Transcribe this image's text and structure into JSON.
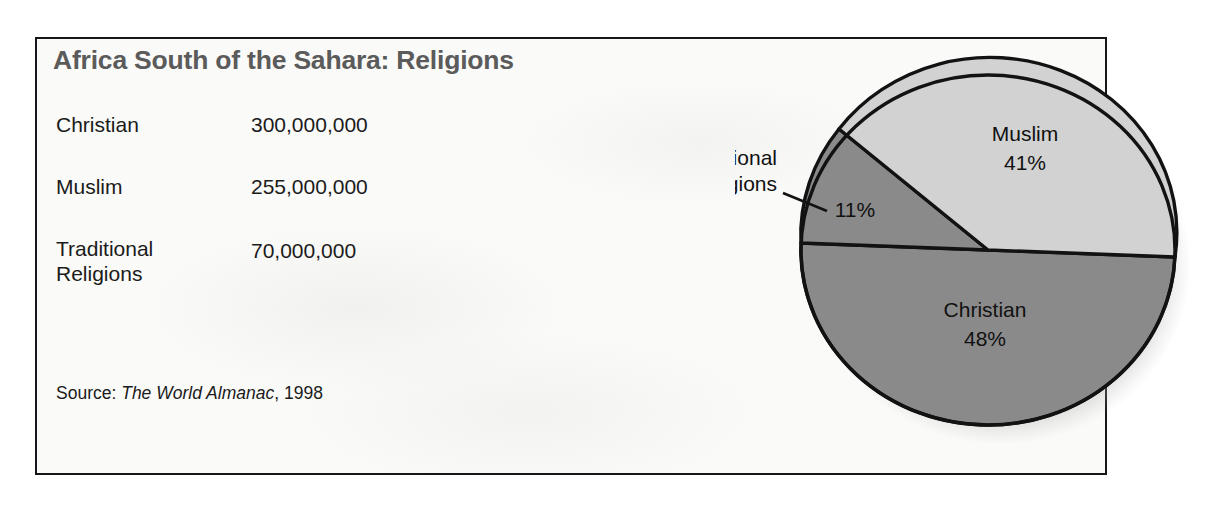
{
  "figure": {
    "title": "Africa South of the Sahara: Religions",
    "source_prefix": "Source: ",
    "source_title": "The World Almanac",
    "source_suffix": ", 1998"
  },
  "table": {
    "rows": [
      {
        "label": "Christian",
        "value": "300,000,000"
      },
      {
        "label": "Muslim",
        "value": "255,000,000"
      },
      {
        "label": "Traditional\nReligions",
        "value": "70,000,000"
      }
    ]
  },
  "pie_labels": {
    "muslim_name": "Muslim",
    "muslim_pct": "41%",
    "christian_name": "Christian",
    "christian_pct": "48%",
    "traditional_callout_line1": "Traditional",
    "traditional_callout_line2": "Religions",
    "traditional_pct": "11%"
  },
  "colors": {
    "christian_fill": "#8a8a8a",
    "muslim_fill": "#d2d2d2",
    "traditional_fill": "#8a8a8a",
    "outline": "#121212",
    "title_gray": "#5b5b5b",
    "panel_bg": "#fafaf8",
    "text": "#1b1b1b"
  },
  "chart_data": {
    "type": "pie",
    "title": "Africa South of the Sahara: Religions",
    "categories": [
      "Christian",
      "Muslim",
      "Traditional Religions"
    ],
    "values": [
      48,
      41,
      11
    ],
    "value_unit": "percent",
    "absolute_values": [
      300000000,
      255000000,
      70000000
    ],
    "absolute_unit": "people",
    "labels": [
      "Christian 48%",
      "Muslim 41%",
      "Traditional Religions 11%"
    ],
    "slice_colors": [
      "#8a8a8a",
      "#d2d2d2",
      "#8a8a8a"
    ],
    "legend": "none",
    "data_labels": true,
    "source": "The World Almanac, 1998",
    "start_angle_deg": 0,
    "direction": "clockwise"
  }
}
